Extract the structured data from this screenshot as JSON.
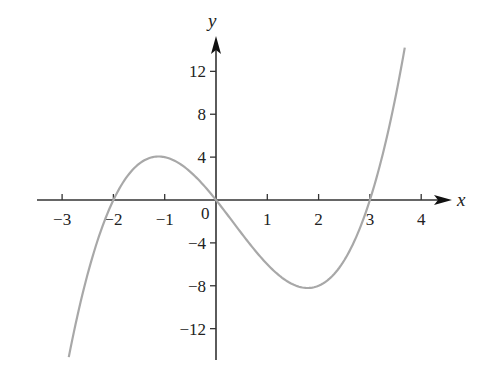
{
  "chart_data": {
    "type": "line",
    "title": "",
    "xlabel": "x",
    "ylabel": "y",
    "function": "y = x(x + 2)(x - 3) = x^3 - x^2 - 6x",
    "x_ticks": [
      -3,
      -2,
      -1,
      0,
      1,
      2,
      3,
      4
    ],
    "x_tick_labels": [
      "−3",
      "−2",
      "−1",
      "0",
      "1",
      "2",
      "3",
      "4"
    ],
    "y_ticks": [
      12,
      8,
      4,
      -4,
      -8,
      -12
    ],
    "y_tick_labels": [
      "12",
      "8",
      "4",
      "−4",
      "−8",
      "−12"
    ],
    "xlim": [
      -3.5,
      4.6
    ],
    "ylim": [
      -15,
      15
    ],
    "grid": false,
    "legend": null,
    "series": [
      {
        "name": "curve",
        "color": "#a8a8a8",
        "x_range": [
          -2.87,
          3.68
        ],
        "points": [
          {
            "x": -2.87,
            "y": -14.7
          },
          {
            "x": -2,
            "y": 0
          },
          {
            "x": -1.12,
            "y": 4.06
          },
          {
            "x": 0,
            "y": 0
          },
          {
            "x": 1.79,
            "y": -8.21
          },
          {
            "x": 3,
            "y": 0
          },
          {
            "x": 3.68,
            "y": 14.2
          }
        ]
      }
    ],
    "annotations": {
      "x_intercepts": [
        -2,
        0,
        3
      ],
      "local_max": {
        "x": -1.12,
        "y": 4.06
      },
      "local_min": {
        "x": 1.79,
        "y": -8.21
      }
    }
  },
  "labels": {
    "origin": "0",
    "x_axis": "x",
    "y_axis": "y"
  },
  "colors": {
    "axis": "#333333",
    "curve": "#a8a8a8",
    "text": "#222222"
  }
}
